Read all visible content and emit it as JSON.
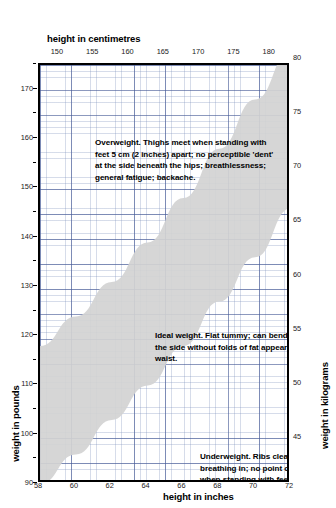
{
  "chart_data": {
    "type": "area",
    "title": "",
    "subtitle": "",
    "xlabel": "height in inches",
    "xlabel_top": "height in centimetres",
    "ylabel": "weight in pounds",
    "ylabel_right": "weight in kilograms",
    "xlim": [
      58,
      72
    ],
    "xlim_cm": [
      147.32,
      182.88
    ],
    "ylim": [
      90,
      175
    ],
    "ylim_kg": [
      40.8,
      79.4
    ],
    "grid": true,
    "legend_position": "none",
    "x_ticks_bottom": [
      "58",
      "60",
      "62",
      "64",
      "66",
      "68",
      "70",
      "72"
    ],
    "x_tick_values_bottom": [
      58,
      60,
      62,
      64,
      66,
      68,
      70,
      72
    ],
    "x_ticks_top": [
      "150",
      "155",
      "160",
      "165",
      "170",
      "175",
      "180"
    ],
    "x_tick_values_top_cm": [
      150,
      155,
      160,
      165,
      170,
      175,
      180
    ],
    "y_ticks_left": [
      "90",
      "100",
      "110",
      "120",
      "130",
      "140",
      "150",
      "160",
      "170"
    ],
    "y_tick_values_left": [
      90,
      100,
      110,
      120,
      130,
      140,
      150,
      160,
      170
    ],
    "y_ticks_right": [
      "45",
      "50",
      "55",
      "60",
      "65",
      "70",
      "75",
      "80"
    ],
    "y_tick_values_right_kg": [
      45,
      50,
      55,
      60,
      65,
      70,
      75,
      80
    ],
    "series": [
      {
        "name": "ideal weight band - upper bound",
        "x": [
          58,
          60,
          62,
          64,
          66,
          68,
          70,
          72
        ],
        "values": [
          118,
          124,
          131,
          139,
          148,
          158,
          168,
          178
        ]
      },
      {
        "name": "ideal weight band - lower bound",
        "x": [
          58,
          60,
          62,
          64,
          66,
          68,
          70,
          72
        ],
        "values": [
          90,
          96,
          103,
          110,
          118,
          127,
          136,
          146
        ]
      }
    ],
    "regions": [
      {
        "name": "Overweight",
        "position": "above band"
      },
      {
        "name": "Ideal weight",
        "position": "inside shaded band"
      },
      {
        "name": "Underweight",
        "position": "below band"
      }
    ],
    "band_color": "#d2d2d2",
    "grid_color": "#6a7fb0",
    "frame_color": "#000000"
  },
  "axes": {
    "top_title": "height in centimetres",
    "bottom_title": "height in inches",
    "left_title": "weight in pounds",
    "right_title": "weight in kilograms"
  },
  "annotations": {
    "overweight": "Overweight. Thighs meet when standing with feet 5 cm (2 inches) apart; no perceptible 'dent' at the side beneath the hips; breathlessness; general fatigue; backache.",
    "ideal": "Ideal weight. Flat tummy; can bend easily to the side without folds of fat appearing at the waist.",
    "underweight": "Underweight. Ribs clearly visible on breathing in; no point of contact at thighs when standing with feet together; hollows in face; irregular or absent periods."
  }
}
